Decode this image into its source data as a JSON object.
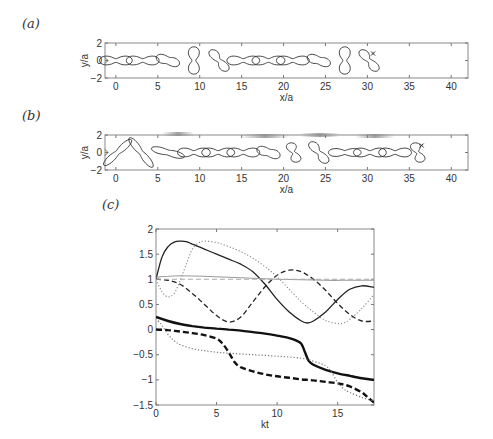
{
  "labels": {
    "a": "(a)",
    "b": "(b)",
    "c": "(c)"
  },
  "chart_data": [
    {
      "id": "a",
      "type": "line",
      "title": "",
      "xlabel": "x/a",
      "ylabel": "y/a",
      "xlim": [
        -1.3,
        42
      ],
      "ylim": [
        -2,
        2
      ],
      "xticks": [
        0,
        5,
        10,
        15,
        20,
        25,
        30,
        35,
        40
      ],
      "yticks": [
        -2,
        0,
        2
      ],
      "grid": false,
      "shape_snapshots": [
        {
          "x": 0,
          "kind": "peanut-h"
        },
        {
          "x": 3.2,
          "kind": "peanut-h"
        },
        {
          "x": 6.2,
          "kind": "s-shape"
        },
        {
          "x": 9.3,
          "kind": "hourglass-v"
        },
        {
          "x": 12.3,
          "kind": "s-tilt"
        },
        {
          "x": 15.2,
          "kind": "peanut-h"
        },
        {
          "x": 18.2,
          "kind": "peanut-h"
        },
        {
          "x": 21.1,
          "kind": "peanut-h"
        },
        {
          "x": 24.2,
          "kind": "s-shape"
        },
        {
          "x": 27.3,
          "kind": "hourglass-v"
        },
        {
          "x": 30.2,
          "kind": "s-tilt",
          "marker": true
        }
      ]
    },
    {
      "id": "b",
      "type": "line",
      "title": "",
      "xlabel": "x/a",
      "ylabel": "y/a",
      "xlim": [
        -1.3,
        42
      ],
      "ylim": [
        -2,
        2
      ],
      "xticks": [
        0,
        5,
        10,
        15,
        20,
        25,
        30,
        35,
        40
      ],
      "yticks": [
        -2,
        0,
        2
      ],
      "grid": false,
      "shape_snapshots": [
        {
          "x": 0.2,
          "kind": "dumbbell-diag"
        },
        {
          "x": 3.0,
          "kind": "dumbbell-diag-rev"
        },
        {
          "x": 6.2,
          "kind": "peanut-tilt"
        },
        {
          "x": 9.3,
          "kind": "peanut-h"
        },
        {
          "x": 12.2,
          "kind": "peanut-h"
        },
        {
          "x": 15.2,
          "kind": "peanut-h"
        },
        {
          "x": 18.2,
          "kind": "s-shape"
        },
        {
          "x": 21.2,
          "kind": "s-small"
        },
        {
          "x": 24.2,
          "kind": "s-tilt"
        },
        {
          "x": 27.3,
          "kind": "bowtie"
        },
        {
          "x": 30.3,
          "kind": "peanut-h"
        },
        {
          "x": 33.3,
          "kind": "peanut-h"
        },
        {
          "x": 36.0,
          "kind": "s-small",
          "marker": true
        }
      ]
    },
    {
      "id": "c",
      "type": "line",
      "title": "",
      "xlabel": "kt",
      "ylabel": "",
      "xlim": [
        0,
        18
      ],
      "ylim": [
        -1.5,
        2
      ],
      "xticks": [
        0,
        5,
        10,
        15
      ],
      "yticks": [
        -1.5,
        -1,
        -0.5,
        0,
        0.5,
        1,
        1.5,
        2
      ],
      "grid": false,
      "legend": null,
      "series": [
        {
          "name": "black-solid-thin",
          "style": "solid",
          "color": "#222222",
          "width": 1.3,
          "x": [
            0,
            0.5,
            1,
            1.5,
            2,
            2.5,
            3,
            4,
            5,
            6,
            7,
            8,
            9,
            10,
            11,
            12,
            12.5,
            13,
            14,
            15,
            16,
            17,
            18
          ],
          "y": [
            1.0,
            1.45,
            1.65,
            1.74,
            1.76,
            1.75,
            1.7,
            1.6,
            1.5,
            1.4,
            1.3,
            1.15,
            0.9,
            0.6,
            0.35,
            0.17,
            0.13,
            0.17,
            0.35,
            0.6,
            0.8,
            0.87,
            0.84
          ]
        },
        {
          "name": "black-dashed-thin",
          "style": "dashed",
          "color": "#222222",
          "width": 1.3,
          "x": [
            0,
            1,
            2,
            3,
            4,
            5,
            6,
            7,
            8,
            9,
            10,
            11,
            12,
            13,
            14,
            15,
            16,
            17,
            18
          ],
          "y": [
            1.0,
            0.98,
            0.9,
            0.72,
            0.5,
            0.28,
            0.15,
            0.25,
            0.55,
            0.85,
            1.08,
            1.18,
            1.15,
            1.0,
            0.78,
            0.52,
            0.3,
            0.17,
            0.17
          ]
        },
        {
          "name": "gray-dotted-thin",
          "style": "dotted",
          "color": "#888888",
          "width": 1.1,
          "x": [
            0,
            0.5,
            1,
            1.5,
            2,
            2.5,
            3,
            3.5,
            4,
            5,
            6,
            7,
            8,
            9,
            10,
            11,
            12,
            13,
            14,
            15,
            15.5,
            16,
            17,
            18
          ],
          "y": [
            1.0,
            0.75,
            0.65,
            0.72,
            0.98,
            1.3,
            1.6,
            1.72,
            1.76,
            1.73,
            1.65,
            1.55,
            1.42,
            1.25,
            1.05,
            0.8,
            0.55,
            0.35,
            0.18,
            0.12,
            0.13,
            0.2,
            0.42,
            0.7
          ]
        },
        {
          "name": "gray-solid",
          "style": "solid",
          "color": "#9a9a9a",
          "width": 1.1,
          "x": [
            0,
            1,
            2,
            4,
            6,
            8,
            10,
            12,
            14,
            16,
            18
          ],
          "y": [
            1.04,
            1.06,
            1.07,
            1.06,
            1.04,
            1.02,
            1.0,
            0.99,
            0.98,
            0.98,
            0.98
          ]
        },
        {
          "name": "gray-dashed",
          "style": "dashed",
          "color": "#aaaaaa",
          "width": 1.1,
          "x": [
            0,
            18
          ],
          "y": [
            1.0,
            1.0
          ]
        },
        {
          "name": "black-solid-thick",
          "style": "solid",
          "color": "#111111",
          "width": 2.4,
          "x": [
            0,
            1,
            2,
            3,
            4,
            5,
            6,
            7,
            8,
            9,
            10,
            11,
            11.5,
            12,
            12.3,
            12.6,
            13,
            14,
            15,
            16,
            17,
            18
          ],
          "y": [
            0.25,
            0.17,
            0.11,
            0.07,
            0.04,
            0.02,
            0.0,
            -0.02,
            -0.05,
            -0.08,
            -0.12,
            -0.17,
            -0.21,
            -0.28,
            -0.45,
            -0.62,
            -0.7,
            -0.8,
            -0.87,
            -0.92,
            -0.97,
            -1.0
          ]
        },
        {
          "name": "black-dashed-thick",
          "style": "dashed",
          "color": "#111111",
          "width": 2.4,
          "x": [
            0,
            1,
            2,
            3,
            4,
            5,
            5.5,
            6,
            6.5,
            7,
            8,
            9,
            10,
            11,
            12,
            13,
            14,
            15,
            16,
            17,
            17.5,
            18
          ],
          "y": [
            0.0,
            -0.01,
            -0.04,
            -0.07,
            -0.11,
            -0.18,
            -0.28,
            -0.45,
            -0.65,
            -0.75,
            -0.83,
            -0.89,
            -0.93,
            -0.96,
            -0.99,
            -1.01,
            -1.04,
            -1.07,
            -1.13,
            -1.25,
            -1.35,
            -1.45
          ]
        },
        {
          "name": "gray-dotted-lower",
          "style": "dotted",
          "color": "#777777",
          "width": 1.2,
          "x": [
            0,
            0.5,
            1,
            1.5,
            2,
            3,
            4,
            5,
            6,
            8,
            10,
            12,
            13,
            14,
            14.5,
            15,
            15.5,
            16,
            17,
            18
          ],
          "y": [
            0.22,
            0.08,
            -0.1,
            -0.22,
            -0.3,
            -0.38,
            -0.42,
            -0.45,
            -0.47,
            -0.5,
            -0.53,
            -0.57,
            -0.63,
            -0.72,
            -0.85,
            -1.05,
            -1.18,
            -1.25,
            -1.35,
            -1.42
          ]
        }
      ]
    }
  ]
}
